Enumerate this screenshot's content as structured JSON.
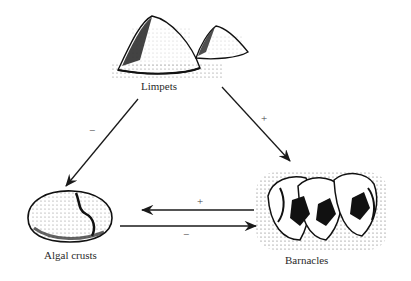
{
  "nodes": {
    "limpets": {
      "label": "Limpets"
    },
    "algal_crusts": {
      "label": "Algal crusts"
    },
    "barnacles": {
      "label": "Barnacles"
    }
  },
  "edges": [
    {
      "from": "Limpets",
      "to": "Algal crusts",
      "sign": "−"
    },
    {
      "from": "Limpets",
      "to": "Barnacles",
      "sign": "+"
    },
    {
      "from": "Barnacles",
      "to": "Algal crusts",
      "sign": "+"
    },
    {
      "from": "Algal crusts",
      "to": "Barnacles",
      "sign": "−"
    }
  ],
  "colors": {
    "ink": "#1a1a1a",
    "background": "#ffffff"
  }
}
